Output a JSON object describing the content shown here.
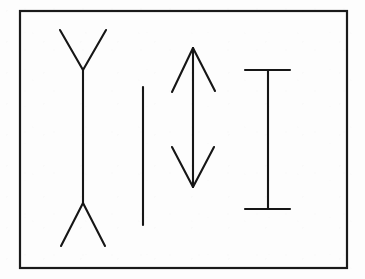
{
  "canvas": {
    "width": 365,
    "height": 279,
    "background_color": "#fdfdfd",
    "ink_color": "#161616"
  },
  "frame": {
    "name": "outer-border",
    "x": 20,
    "y": 11,
    "width": 327,
    "height": 257,
    "stroke_width": 2.2,
    "stroke_color": "#1a1a1a"
  },
  "chart_data": {
    "type": "diagram",
    "title": "",
    "subtitle": "",
    "xlabel": "",
    "ylabel": "",
    "grid": false,
    "legend": "none",
    "figures": [
      {
        "id": "figure-1",
        "label": "outward-fins-arrow",
        "fin_direction": "outward",
        "shaft_x": 83,
        "shaft_top_y": 70,
        "shaft_bottom_y": 203,
        "shaft_length": 133,
        "stroke_width": 2.1,
        "fins": [
          {
            "name": "top-left-fin",
            "x1": 83,
            "y1": 70,
            "x2": 60,
            "y2": 30
          },
          {
            "name": "top-right-fin",
            "x1": 83,
            "y1": 70,
            "x2": 106,
            "y2": 30
          },
          {
            "name": "bottom-left-fin",
            "x1": 83,
            "y1": 203,
            "x2": 61,
            "y2": 246
          },
          {
            "name": "bottom-right-fin",
            "x1": 83,
            "y1": 203,
            "x2": 105,
            "y2": 246
          }
        ]
      },
      {
        "id": "figure-2",
        "label": "plain-line",
        "fin_direction": "none",
        "shaft_x": 143,
        "shaft_top_y": 87,
        "shaft_bottom_y": 225,
        "shaft_length": 138,
        "stroke_width": 2.1,
        "fins": []
      },
      {
        "id": "figure-3",
        "label": "inward-fins-double-arrow",
        "fin_direction": "inward",
        "shaft_x": 193,
        "shaft_top_y": 48,
        "shaft_bottom_y": 187,
        "shaft_length": 139,
        "stroke_width": 2.1,
        "fins": [
          {
            "name": "top-left-fin",
            "x1": 193,
            "y1": 48,
            "x2": 172,
            "y2": 92
          },
          {
            "name": "top-right-fin",
            "x1": 193,
            "y1": 48,
            "x2": 215,
            "y2": 91
          },
          {
            "name": "bottom-left-fin",
            "x1": 193,
            "y1": 187,
            "x2": 172,
            "y2": 147
          },
          {
            "name": "bottom-right-fin",
            "x1": 193,
            "y1": 187,
            "x2": 214,
            "y2": 147
          }
        ]
      },
      {
        "id": "figure-4",
        "label": "perpendicular-caps-i-beam",
        "fin_direction": "perpendicular",
        "shaft_x": 268,
        "shaft_top_y": 70,
        "shaft_bottom_y": 209,
        "shaft_length": 139,
        "stroke_width": 2.1,
        "fins": [
          {
            "name": "top-cap",
            "x1": 245,
            "y1": 70,
            "x2": 290,
            "y2": 70
          },
          {
            "name": "bottom-cap",
            "x1": 245,
            "y1": 209,
            "x2": 290,
            "y2": 209
          }
        ]
      }
    ]
  }
}
